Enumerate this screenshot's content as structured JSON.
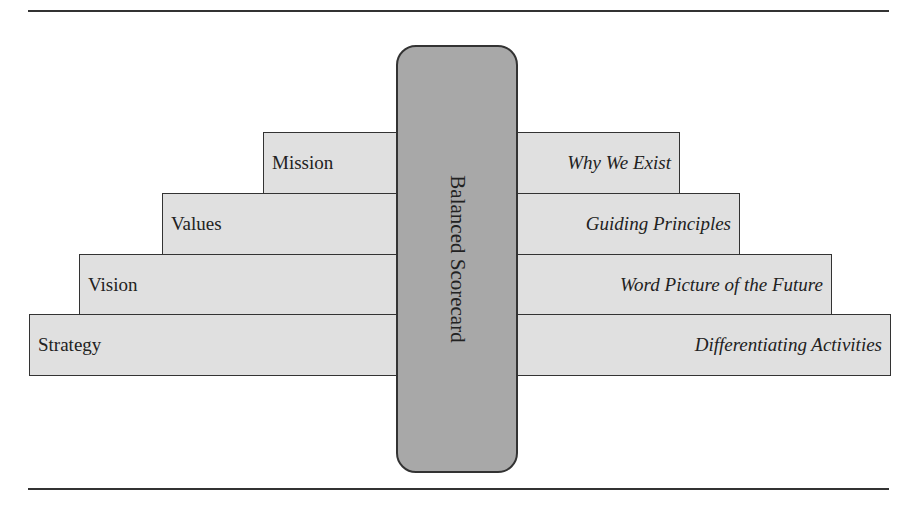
{
  "diagram": {
    "type": "stepped pyramid with central pillar",
    "pillar": {
      "label": "Balanced Scorecard",
      "fill": "#a8a8a8"
    },
    "levels": [
      {
        "name": "Mission",
        "description": "Why We Exist"
      },
      {
        "name": "Values",
        "description": "Guiding Principles"
      },
      {
        "name": "Vision",
        "description": "Word Picture of the Future"
      },
      {
        "name": "Strategy",
        "description": "Differentiating Activities"
      }
    ],
    "colors": {
      "step_fill": "#e0e0e0",
      "border": "#333333",
      "rule": "#333333"
    }
  }
}
